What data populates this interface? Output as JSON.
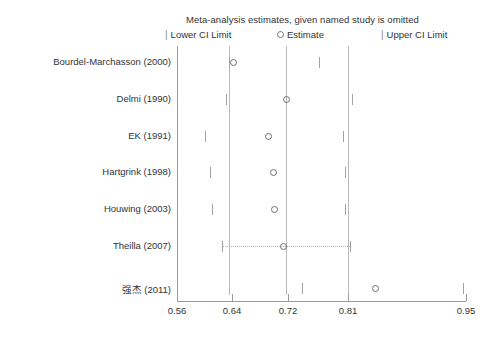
{
  "chart_data": {
    "type": "scatter",
    "title": "Meta-analysis estimates, given named study is omitted",
    "xlabel": "",
    "ylabel": "",
    "grid": false,
    "legend_position": "top",
    "legend": [
      {
        "marker": "tick",
        "label": "Lower CI Limit"
      },
      {
        "marker": "circle",
        "label": "Estimate"
      },
      {
        "marker": "tick",
        "label": "Upper CI Limit"
      }
    ],
    "x_tick_labels": [
      "0.56",
      "0.64",
      "0.72",
      "0.81",
      "0.95"
    ],
    "x_tick_values": [
      0.56,
      0.64,
      0.72,
      0.81,
      0.95
    ],
    "x_tick_positions_px": [
      177,
      232,
      288,
      348,
      466
    ],
    "xlim": [
      0.56,
      0.95
    ],
    "reference_lines": [
      {
        "label": "0.64",
        "value": 0.64,
        "x_px": 229
      },
      {
        "label": "0.72",
        "value": 0.72,
        "x_px": 286
      },
      {
        "label": "0.81",
        "value": 0.81,
        "x_px": 348
      }
    ],
    "categories": [
      "Bourdel-Marchasson (2000)",
      "Delmi (1990)",
      "EK (1991)",
      "Hartgrink (1998)",
      "Houwing (2003)",
      "Theilla (2007)",
      "强杰 (2011)"
    ],
    "series": [
      {
        "name": "Lower CI Limit",
        "values": [
          0.639,
          0.631,
          0.601,
          0.608,
          0.61,
          0.626,
          0.745
        ],
        "x_px": [
          229,
          226,
          205,
          210,
          212,
          222,
          302
        ]
      },
      {
        "name": "Estimate",
        "values": [
          0.645,
          0.72,
          0.69,
          0.697,
          0.698,
          0.716,
          0.856
        ],
        "x_px": [
          233,
          286,
          268,
          273,
          274,
          283,
          375
        ]
      },
      {
        "name": "Upper CI Limit",
        "values": [
          0.767,
          0.815,
          0.798,
          0.804,
          0.804,
          0.811,
          0.946
        ],
        "x_px": [
          319,
          352,
          343,
          345,
          345,
          350,
          463
        ]
      }
    ],
    "rows": [
      {
        "label": "Bourdel-Marchasson (2000)",
        "y_px": 62,
        "lower_px": 229,
        "estimate_px": 233,
        "upper_px": 319,
        "connector": false
      },
      {
        "label": "Delmi (1990)",
        "y_px": 99,
        "lower_px": 226,
        "estimate_px": 286,
        "upper_px": 352,
        "connector": false
      },
      {
        "label": "EK (1991)",
        "y_px": 136,
        "lower_px": 205,
        "estimate_px": 268,
        "upper_px": 343,
        "connector": false
      },
      {
        "label": "Hartgrink (1998)",
        "y_px": 172,
        "lower_px": 210,
        "estimate_px": 273,
        "upper_px": 345,
        "connector": false
      },
      {
        "label": "Houwing (2003)",
        "y_px": 209,
        "lower_px": 212,
        "estimate_px": 274,
        "upper_px": 345,
        "connector": false
      },
      {
        "label": "Theilla (2007)",
        "y_px": 246,
        "lower_px": 222,
        "estimate_px": 283,
        "upper_px": 350,
        "connector": true
      },
      {
        "label": "强杰 (2011)",
        "y_px": 288,
        "lower_px": 302,
        "estimate_px": 375,
        "upper_px": 463,
        "connector": false
      }
    ],
    "colors": {
      "axis": "#9a9a9a",
      "reference_line": "#b9b9b9",
      "marker_stroke": "#6f6f6f",
      "tick_mark": "#a2a2a2",
      "text": "#333333",
      "background": "#ffffff"
    }
  }
}
